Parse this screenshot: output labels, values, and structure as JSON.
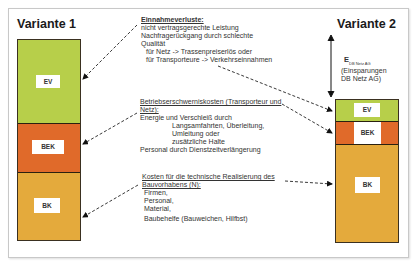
{
  "variant1": {
    "title": "Variante 1",
    "segments": {
      "ev": "EV",
      "bek": "BEK",
      "bk": "BK"
    }
  },
  "variant2": {
    "title": "Variante 2",
    "segments": {
      "ev": "EV",
      "bek": "BEK",
      "bk": "BK"
    },
    "savings_symbol": "E",
    "savings_subscript": "DB Netz AG",
    "savings_line1": "(Einsparungen",
    "savings_line2": "DB Netz AG)"
  },
  "annotations": {
    "ev": {
      "heading": "Einnahmeverluste:",
      "lines": [
        "nicht vertragsgerechte Leistung",
        "Nachfragerückgang durch schlechte",
        "Qualität",
        "für Netz -> Trassenpreiserlös oder",
        "für Transporteure -> Verkehrseinnahmen"
      ]
    },
    "bek": {
      "heading_line1": "Betriebserschwerniskosten (Transporteur und",
      "heading_line2": "Netz):",
      "lines": [
        "Energie und Verschleiß durch",
        "Langsamfahrten, Überleitung,",
        "Umleitung oder",
        "zusätzliche Halte",
        "Personal durch Dienstzeitverlängerung"
      ]
    },
    "bk": {
      "heading_line1": "Kosten für die technische Realisierung des",
      "heading_line2": "Bauvorhabens (N):",
      "lines": [
        "Firmen,",
        "Personal,",
        "Material,",
        "Baubehelfe (Bauweichen, Hilfbst)"
      ]
    }
  },
  "colors": {
    "ev": "#b7cf4a",
    "bek": "#e06a2a",
    "bk": "#e4aa3c"
  }
}
